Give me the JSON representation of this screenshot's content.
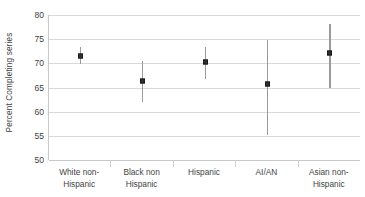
{
  "chart_data": {
    "type": "scatter",
    "title": "",
    "xlabel": "",
    "ylabel": "Percent  Completing series",
    "ylim": [
      50,
      80
    ],
    "yticks": [
      80,
      75,
      70,
      65,
      60,
      55,
      50
    ],
    "ytick_labels": [
      "80",
      "75",
      "70",
      "65",
      "60",
      "55",
      "50"
    ],
    "grid": true,
    "legend": "none",
    "categories": [
      "White non-Hispanic",
      "Black non Hispanic",
      "Hispanic",
      "AI/AN",
      "Asian non-Hispanic"
    ],
    "category_lines": [
      [
        "White non-",
        "Hispanic"
      ],
      [
        "Black non",
        "Hispanic"
      ],
      [
        "Hispanic"
      ],
      [
        "AI/AN"
      ],
      [
        "Asian non-",
        "Hispanic"
      ]
    ],
    "values": [
      71.5,
      66.4,
      70.2,
      65.7,
      72.1
    ],
    "error_low": [
      69.9,
      61.9,
      66.7,
      55.2,
      64.8
    ],
    "error_high": [
      73.3,
      70.4,
      73.3,
      74.8,
      78.2
    ],
    "series": [
      {
        "name": "Percent Completing series",
        "points": [
          {
            "category": "White non-Hispanic",
            "value": 71.5,
            "ci_low": 69.9,
            "ci_high": 73.3
          },
          {
            "category": "Black non Hispanic",
            "value": 66.4,
            "ci_low": 61.9,
            "ci_high": 70.4
          },
          {
            "category": "Hispanic",
            "value": 70.2,
            "ci_low": 66.7,
            "ci_high": 73.3
          },
          {
            "category": "AI/AN",
            "value": 65.7,
            "ci_low": 55.2,
            "ci_high": 74.8
          },
          {
            "category": "Asian non-Hispanic",
            "value": 72.1,
            "ci_low": 64.8,
            "ci_high": 78.2
          }
        ]
      }
    ],
    "colors": {
      "marker": "#2f2f2f",
      "whisker": "#9a9a9a",
      "gridline": "#d9d9d9",
      "axis": "#c8c8c8",
      "text": "#3f3f3f",
      "background": "#ffffff"
    }
  }
}
